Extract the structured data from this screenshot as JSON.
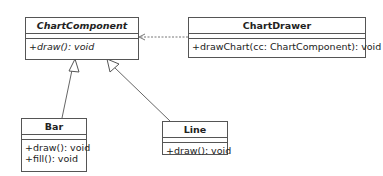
{
  "diagram": {
    "type": "uml-class-diagram",
    "classes": [
      {
        "id": "ChartComponent",
        "name": "ChartComponent",
        "abstract": true,
        "attributes": [],
        "operations": [
          "+draw(): void"
        ]
      },
      {
        "id": "ChartDrawer",
        "name": "ChartDrawer",
        "abstract": false,
        "attributes": [],
        "operations": [
          "+drawChart(cc: ChartComponent): void"
        ]
      },
      {
        "id": "Bar",
        "name": "Bar",
        "abstract": false,
        "attributes": [],
        "operations": [
          "+draw(): void",
          "+fill(): void"
        ]
      },
      {
        "id": "Line",
        "name": "Line",
        "abstract": false,
        "attributes": [],
        "operations": [
          "+draw(): void"
        ]
      }
    ],
    "relationships": [
      {
        "type": "dependency",
        "from": "ChartDrawer",
        "to": "ChartComponent",
        "style": "dashed-open-arrow"
      },
      {
        "type": "generalization",
        "from": "Bar",
        "to": "ChartComponent",
        "style": "hollow-triangle"
      },
      {
        "type": "generalization",
        "from": "Line",
        "to": "ChartComponent",
        "style": "hollow-triangle"
      }
    ],
    "colors": {
      "line": "#555555",
      "background": "#ffffff",
      "text": "#222222"
    }
  }
}
